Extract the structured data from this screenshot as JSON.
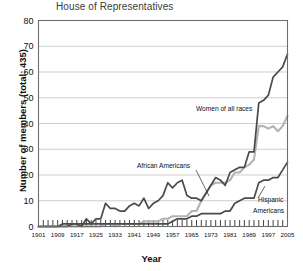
{
  "chart_data": {
    "type": "line",
    "title": "House of Representatives",
    "xlabel": "Year",
    "ylabel": "Number of members (total: 435)",
    "ylim": [
      0,
      80
    ],
    "ytick_labels": [
      "0",
      "10",
      "20",
      "30",
      "40",
      "50",
      "60",
      "70",
      "80"
    ],
    "xlim": [
      1901,
      2005
    ],
    "xtick_labels": [
      "1901",
      "1909",
      "1917",
      "1925",
      "1933",
      "1941",
      "1949",
      "1957",
      "1965",
      "1973",
      "1981",
      "1989",
      "1997",
      "2005"
    ],
    "xtick_step_minor": 2,
    "grid": "horizontal",
    "legend_position": "inline-annotations",
    "x": [
      1901,
      1903,
      1905,
      1907,
      1909,
      1911,
      1913,
      1915,
      1917,
      1919,
      1921,
      1923,
      1925,
      1927,
      1929,
      1931,
      1933,
      1935,
      1937,
      1939,
      1941,
      1943,
      1945,
      1947,
      1949,
      1951,
      1953,
      1955,
      1957,
      1959,
      1961,
      1963,
      1965,
      1967,
      1969,
      1971,
      1973,
      1975,
      1977,
      1979,
      1981,
      1983,
      1985,
      1987,
      1989,
      1991,
      1993,
      1995,
      1997,
      1999,
      2001,
      2003,
      2005
    ],
    "series": [
      {
        "name": "Women of all races",
        "color": "#4a4a4a",
        "values": [
          0,
          0,
          0,
          0,
          0,
          0,
          0,
          1,
          1,
          0,
          3,
          1,
          3,
          3,
          9,
          7,
          7,
          6,
          6,
          8,
          9,
          8,
          11,
          7,
          9,
          10,
          12,
          17,
          15,
          17,
          18,
          12,
          11,
          11,
          10,
          13,
          16,
          19,
          18,
          16,
          21,
          22,
          23,
          23,
          29,
          29,
          48,
          49,
          51,
          58,
          60,
          62,
          67
        ]
      },
      {
        "name": "African Americans",
        "color": "#b3b3b3",
        "values": [
          0,
          0,
          0,
          0,
          0,
          0,
          0,
          0,
          0,
          0,
          0,
          0,
          0,
          0,
          1,
          1,
          0,
          1,
          1,
          1,
          1,
          1,
          2,
          2,
          2,
          2,
          3,
          3,
          4,
          4,
          4,
          4,
          6,
          6,
          10,
          13,
          16,
          17,
          17,
          17,
          18,
          21,
          21,
          23,
          24,
          26,
          39,
          39,
          38,
          39,
          37,
          39,
          43
        ]
      },
      {
        "name": "Hispanic Americans",
        "color": "#4a4a4a",
        "values": [
          0,
          0,
          0,
          0,
          0,
          1,
          1,
          1,
          1,
          1,
          1,
          1,
          1,
          1,
          1,
          1,
          1,
          1,
          1,
          1,
          1,
          1,
          1,
          1,
          1,
          1,
          1,
          1,
          2,
          3,
          3,
          3,
          4,
          4,
          5,
          5,
          5,
          5,
          5,
          6,
          6,
          9,
          10,
          11,
          11,
          11,
          17,
          18,
          18,
          19,
          19,
          22,
          25
        ]
      }
    ],
    "annotations": [
      {
        "name": "women-of-all-races-label",
        "text": "Women of all races"
      },
      {
        "name": "african-americans-label",
        "text": "African Americans"
      },
      {
        "name": "hispanic-americans-label-line1",
        "text": "Hispanic"
      },
      {
        "name": "hispanic-americans-label-line2",
        "text": "Americans"
      }
    ]
  }
}
